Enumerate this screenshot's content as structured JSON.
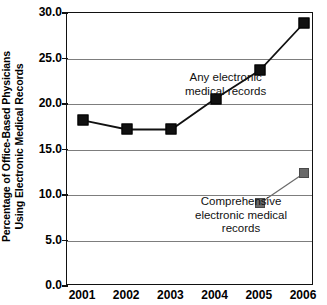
{
  "chart_data": {
    "type": "line",
    "title": "",
    "xlabel": "",
    "ylabel": "Percentage of Office-Based Physicians Using Electronic Medical Records",
    "ylabel_lines": [
      "Percentage of Office-Based Physicians",
      "Using Electronic Medical Records"
    ],
    "categories": [
      "2001",
      "2002",
      "2003",
      "2004",
      "2005",
      "2006"
    ],
    "x": [
      2001,
      2002,
      2003,
      2004,
      2005,
      2006
    ],
    "ylim": [
      0.0,
      30.0
    ],
    "ytick_labels": [
      "0.0",
      "5.0",
      "10.0",
      "15.0",
      "20.0",
      "25.0",
      "30.0"
    ],
    "ytick_values": [
      0.0,
      5.0,
      10.0,
      15.0,
      20.0,
      25.0,
      30.0
    ],
    "grid": "horizontal",
    "legend": "none (inline annotations)",
    "series": [
      {
        "name": "Any electronic medical records",
        "color": "#111111",
        "marker": "square",
        "x": [
          2001,
          2002,
          2003,
          2004,
          2005,
          2006
        ],
        "values": [
          18.2,
          17.2,
          17.2,
          20.6,
          23.7,
          28.9
        ]
      },
      {
        "name": "Comprehensive electronic medical records",
        "color": "#6a6a6a",
        "marker": "square",
        "x": [
          2005,
          2006
        ],
        "values": [
          9.1,
          12.4
        ]
      }
    ],
    "annotations": [
      {
        "id": "any",
        "lines": [
          "Any electronic",
          "medical records"
        ],
        "refers_to": "Any electronic medical records"
      },
      {
        "id": "comprehensive",
        "lines": [
          "Comprehensive",
          "electronic medical",
          "records"
        ],
        "refers_to": "Comprehensive electronic medical records"
      }
    ]
  },
  "colors": {
    "series_dark": "#111111",
    "series_gray": "#6a6a6a",
    "gridline": "#7d7d7d",
    "frame": "#111111",
    "background": "#ffffff"
  }
}
